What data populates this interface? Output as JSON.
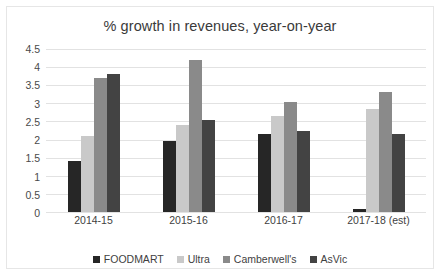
{
  "chart_data": {
    "type": "bar",
    "title": "% growth in revenues, year-on-year",
    "xlabel": "",
    "ylabel": "",
    "ylim": [
      0,
      4.5
    ],
    "yticks": [
      "4.5",
      "4",
      "3.5",
      "3",
      "2.5",
      "2",
      "1.5",
      "1",
      "0.5",
      "0"
    ],
    "ytick_values": [
      4.5,
      4,
      3.5,
      3,
      2.5,
      2,
      1.5,
      1,
      0.5,
      0
    ],
    "grid": true,
    "legend_position": "bottom",
    "categories": [
      "2014-15",
      "2015-16",
      "2016-17",
      "2017-18 (est)"
    ],
    "series": [
      {
        "name": "FOODMART",
        "color": "#262626",
        "values": [
          1.4,
          1.95,
          2.15,
          0.08
        ]
      },
      {
        "name": "Ultra",
        "color": "#c9c9c9",
        "values": [
          2.1,
          2.4,
          2.65,
          2.85
        ]
      },
      {
        "name": "Camberwell's",
        "color": "#8a8a8a",
        "values": [
          3.7,
          4.2,
          3.05,
          3.3
        ]
      },
      {
        "name": "AsVic",
        "color": "#434343",
        "values": [
          3.8,
          2.55,
          2.25,
          2.15
        ]
      }
    ]
  }
}
